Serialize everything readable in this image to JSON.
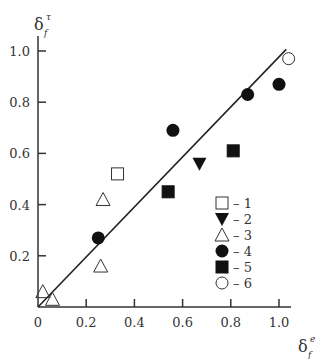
{
  "chart_data": {
    "type": "scatter",
    "title": "",
    "xlabel": "δ_f^e",
    "ylabel": "δ_f^τ",
    "xlabel_main": "δ",
    "xlabel_sup": "e",
    "xlabel_sub": "f",
    "ylabel_main": "δ",
    "ylabel_sup": "τ",
    "ylabel_sub": "f",
    "xlim": [
      0,
      1.05
    ],
    "ylim": [
      0,
      1.05
    ],
    "x_ticks": [
      "0",
      "0.2",
      "0.4",
      "0.6",
      "0.8",
      "1.0"
    ],
    "y_ticks": [
      "0.2",
      "0.4",
      "0.6",
      "0.8",
      "1.0"
    ],
    "grid": false,
    "legend_position": "lower right inside",
    "reference_line": {
      "label": "y = x",
      "x": [
        0,
        1.03
      ],
      "y": [
        0,
        1.03
      ]
    },
    "series": [
      {
        "name": "1",
        "marker": "open-square",
        "points": [
          [
            0.33,
            0.52
          ]
        ]
      },
      {
        "name": "2",
        "marker": "filled-triangle-down",
        "points": [
          [
            0.67,
            0.56
          ]
        ]
      },
      {
        "name": "3",
        "marker": "open-triangle-up",
        "points": [
          [
            0.02,
            0.06
          ],
          [
            0.06,
            0.03
          ],
          [
            0.26,
            0.16
          ],
          [
            0.27,
            0.42
          ]
        ]
      },
      {
        "name": "4",
        "marker": "filled-circle",
        "points": [
          [
            0.25,
            0.27
          ],
          [
            0.56,
            0.69
          ],
          [
            0.87,
            0.83
          ],
          [
            1.0,
            0.87
          ]
        ]
      },
      {
        "name": "5",
        "marker": "filled-square",
        "points": [
          [
            0.54,
            0.45
          ],
          [
            0.81,
            0.61
          ]
        ]
      },
      {
        "name": "6",
        "marker": "open-circle",
        "points": [
          [
            1.04,
            0.97
          ]
        ]
      }
    ]
  },
  "legend": [
    {
      "marker": "open-square",
      "label": "– 1"
    },
    {
      "marker": "filled-triangle-down",
      "label": "– 2"
    },
    {
      "marker": "open-triangle-up",
      "label": "– 3"
    },
    {
      "marker": "filled-circle",
      "label": "– 4"
    },
    {
      "marker": "filled-square",
      "label": "– 5"
    },
    {
      "marker": "open-circle",
      "label": "– 6"
    }
  ]
}
